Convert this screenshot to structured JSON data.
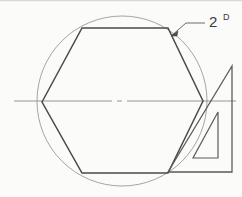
{
  "drawing": {
    "title": "hexagon-inscribed-in-circle-with-set-square",
    "background_color": "#fbfbfa",
    "ink_color": "#3a3a3a",
    "light_ink_color": "#8f8f8f",
    "centerline_color": "#7a7a7a",
    "annotation": {
      "text": "2",
      "superscript": "D",
      "full_label": "2 D",
      "leader_from_x": 205,
      "leader_from_y": 23,
      "leader_elbow_x": 186,
      "leader_elbow_y": 23,
      "arrow_tip_x": 171,
      "arrow_tip_y": 36
    },
    "circle": {
      "center_x": 122,
      "center_y": 101,
      "radius": 85,
      "top_y": 16,
      "bottom_y": 186,
      "left_x": 37,
      "right_x": 207
    },
    "hexagon": {
      "vertices": [
        {
          "name": "left",
          "x": 42,
          "y": 102
        },
        {
          "name": "top-left",
          "x": 82,
          "y": 28
        },
        {
          "name": "top-right",
          "x": 168,
          "y": 28
        },
        {
          "name": "right",
          "x": 203,
          "y": 101
        },
        {
          "name": "bottom-right",
          "x": 168,
          "y": 173
        },
        {
          "name": "bottom-left",
          "x": 82,
          "y": 173
        }
      ],
      "sides": 6
    },
    "centerline": {
      "x_start": 14,
      "x_end": 236,
      "y": 101,
      "style": "dash-dot",
      "center_tick_x": 122
    },
    "set_square": {
      "outer": [
        {
          "x": 232,
          "y": 66
        },
        {
          "x": 232,
          "y": 172
        },
        {
          "x": 168,
          "y": 172
        }
      ],
      "inner_cutout": [
        {
          "x": 218,
          "y": 112
        },
        {
          "x": 218,
          "y": 158
        },
        {
          "x": 193,
          "y": 158
        }
      ]
    }
  }
}
